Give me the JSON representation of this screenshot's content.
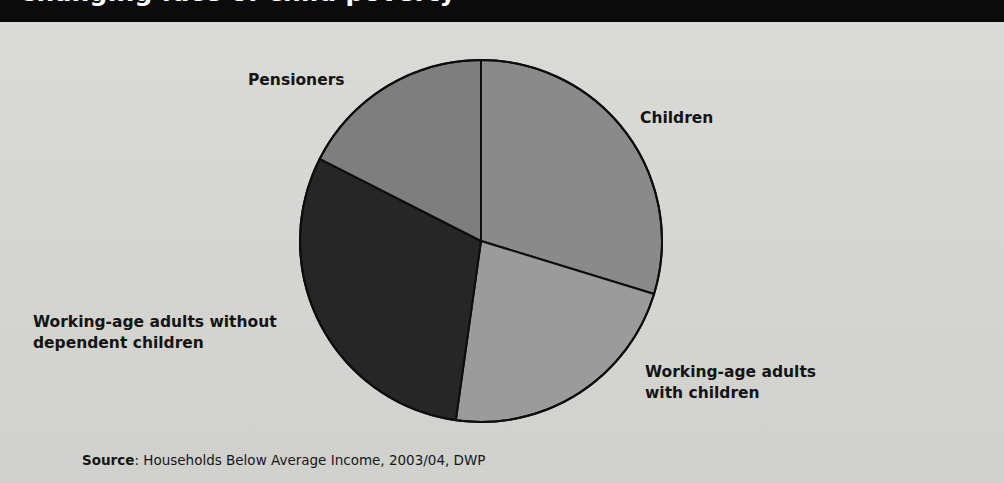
{
  "page": {
    "width": 1004,
    "height": 483,
    "background_color": "#d8d8d4",
    "title_band_color": "#0b0b0b"
  },
  "header": {
    "title": "Changing face of child poverty",
    "title_color": "#ffffff",
    "note": "title is cropped at the top edge of the screenshot"
  },
  "source": {
    "label": "Source",
    "separator": ": ",
    "text": "Households Below Average Income, 2003/04, DWP",
    "full": "Source: Households Below Average Income, 2003/04, DWP"
  },
  "labels": {
    "children": "Children",
    "pensioners": "Pensioners",
    "working_age_without": "Working-age adults without\ndependent children",
    "working_age_with": "Working-age adults\nwith children"
  },
  "chart_data": {
    "type": "pie",
    "title": "Changing face of child poverty",
    "subtitle": "",
    "xlabel": "",
    "ylabel": "",
    "legend_position": "none",
    "grid": false,
    "labels_placement": "outside-callout-free",
    "start_angle_deg": 0,
    "direction": "clockwise",
    "categories": [
      "Children",
      "Working-age adults with children",
      "Working-age adults without dependent children",
      "Pensioners"
    ],
    "values": [
      29.7,
      22.5,
      30.3,
      17.5
    ],
    "value_unit": "percent",
    "slices": [
      {
        "name": "Children",
        "percent": 29.7,
        "start_angle_deg": 0,
        "end_angle_deg": 107,
        "color": "#8a8a8a",
        "label": "Children"
      },
      {
        "name": "Working-age adults with children",
        "percent": 22.5,
        "start_angle_deg": 107,
        "end_angle_deg": 188,
        "color": "#9b9b9b",
        "label": "Working-age adults\nwith children"
      },
      {
        "name": "Working-age adults without dependent children",
        "percent": 30.3,
        "start_angle_deg": 188,
        "end_angle_deg": 297,
        "color": "#262626",
        "label": "Working-age adults without\ndependent children"
      },
      {
        "name": "Pensioners",
        "percent": 17.5,
        "start_angle_deg": 297,
        "end_angle_deg": 360,
        "color": "#7e7e7e",
        "label": "Pensioners"
      }
    ],
    "stroke_color": "#0d0d0d",
    "stroke_width": 2
  }
}
